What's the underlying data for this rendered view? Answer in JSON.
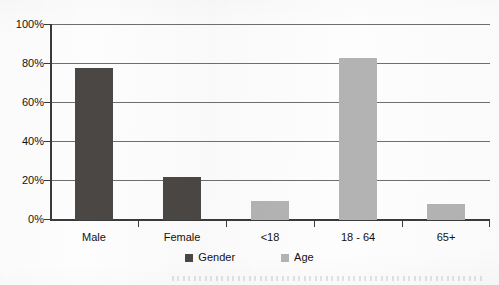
{
  "chart_data": {
    "type": "bar",
    "title": "",
    "subtitle": "",
    "xlabel": "",
    "ylabel": "",
    "categories": [
      "Male",
      "Female",
      "<18",
      "18 - 64",
      "65+"
    ],
    "series": [
      {
        "name": "Gender",
        "color": "#4a4745",
        "values": [
          78,
          22,
          null,
          null,
          null
        ]
      },
      {
        "name": "Age",
        "color": "#b3b3b3",
        "values": [
          null,
          null,
          10,
          83,
          8
        ]
      }
    ],
    "ylim": [
      0,
      100
    ],
    "ytick_labels": [
      "0%",
      "20%",
      "40%",
      "60%",
      "80%",
      "100%"
    ],
    "ytick_values": [
      0,
      20,
      40,
      60,
      80,
      100
    ],
    "grid": true,
    "legend_position": "bottom",
    "legend_entries": [
      {
        "label": "Gender",
        "color": "#4a4745"
      },
      {
        "label": "Age",
        "color": "#b3b3b3"
      }
    ]
  },
  "axis": {
    "y_labels": [
      {
        "text": "100%",
        "value": 100
      },
      {
        "text": "80%",
        "value": 80
      },
      {
        "text": "60%",
        "value": 60
      },
      {
        "text": "40%",
        "value": 40
      },
      {
        "text": "20%",
        "value": 20
      },
      {
        "text": "0%",
        "value": 0
      }
    ],
    "x_labels": [
      "Male",
      "Female",
      "<18",
      "18 - 64",
      "65+"
    ]
  },
  "legend": {
    "items": [
      {
        "label": "Gender"
      },
      {
        "label": "Age"
      }
    ]
  },
  "colors": {
    "gender_series": "#4a4745",
    "age_series": "#b3b3b3",
    "axis": "#3a3a3a",
    "gridline": "#6f6f6f",
    "background": "#fdfdfd"
  }
}
